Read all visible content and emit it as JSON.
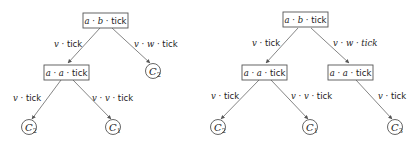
{
  "diagram": {
    "trees": [
      {
        "name": "left-tree",
        "nodes": {
          "root": {
            "label_parts": [
              "a",
              " · ",
              "b",
              " · tick"
            ],
            "kind": "box"
          },
          "n1": {
            "label_parts": [
              "a",
              " · ",
              "a",
              " · tick"
            ],
            "kind": "box"
          },
          "c2_top": {
            "letter": "C",
            "sub": "2",
            "kind": "leaf"
          },
          "c2_bottom": {
            "letter": "C",
            "sub": "2",
            "kind": "leaf"
          },
          "c1": {
            "letter": "C",
            "sub": "1",
            "kind": "leaf"
          }
        },
        "edges": {
          "root_n1": {
            "label_parts": [
              "v",
              " · tick"
            ]
          },
          "root_c2": {
            "label_parts": [
              "v",
              " · ",
              "w",
              " · tick"
            ]
          },
          "n1_c2": {
            "label_parts": [
              "v",
              " · tick"
            ]
          },
          "n1_c1": {
            "label_parts": [
              "v",
              " · ",
              "v",
              " · tick"
            ]
          }
        }
      },
      {
        "name": "right-tree",
        "nodes": {
          "root": {
            "label_parts": [
              "a",
              " · ",
              "b",
              " · tick"
            ],
            "kind": "box"
          },
          "n1": {
            "label_parts": [
              "a",
              " · ",
              "a",
              " · tick"
            ],
            "kind": "box"
          },
          "n2": {
            "label_parts": [
              "a",
              " · ",
              "a",
              " · tick"
            ],
            "kind": "box"
          },
          "c2": {
            "letter": "C",
            "sub": "2",
            "kind": "leaf"
          },
          "c1": {
            "letter": "C",
            "sub": "1",
            "kind": "leaf"
          },
          "c3": {
            "letter": "C",
            "sub": "3",
            "kind": "leaf"
          }
        },
        "edges": {
          "root_n1": {
            "label_parts": [
              "v",
              " · tick"
            ]
          },
          "root_n2": {
            "label_parts": [
              "v",
              " · ",
              "w",
              " · tick"
            ]
          },
          "n1_c2": {
            "label_parts": [
              "v",
              " · tick"
            ]
          },
          "n1_c1": {
            "label_parts": [
              "v",
              " · ",
              "v",
              " · tick"
            ]
          },
          "n2_c3": {
            "label_parts": [
              "v",
              " · tick"
            ]
          }
        }
      }
    ],
    "colors": {
      "stroke": "#555555",
      "text": "#222222",
      "background": "#ffffff"
    }
  }
}
